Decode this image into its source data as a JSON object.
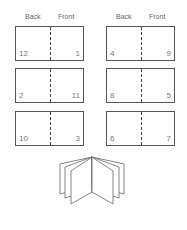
{
  "columns": [
    {
      "back_label": "Back",
      "front_label": "Front"
    },
    {
      "back_label": "Back",
      "front_label": "Front"
    }
  ],
  "sheets": [
    {
      "back": "12",
      "front": "1"
    },
    {
      "back": "4",
      "front": "9"
    },
    {
      "back": "2",
      "front": "11"
    },
    {
      "back": "8",
      "front": "5"
    },
    {
      "back": "10",
      "front": "3"
    },
    {
      "back": "6",
      "front": "7"
    }
  ],
  "illustration": "open-booklet-icon"
}
